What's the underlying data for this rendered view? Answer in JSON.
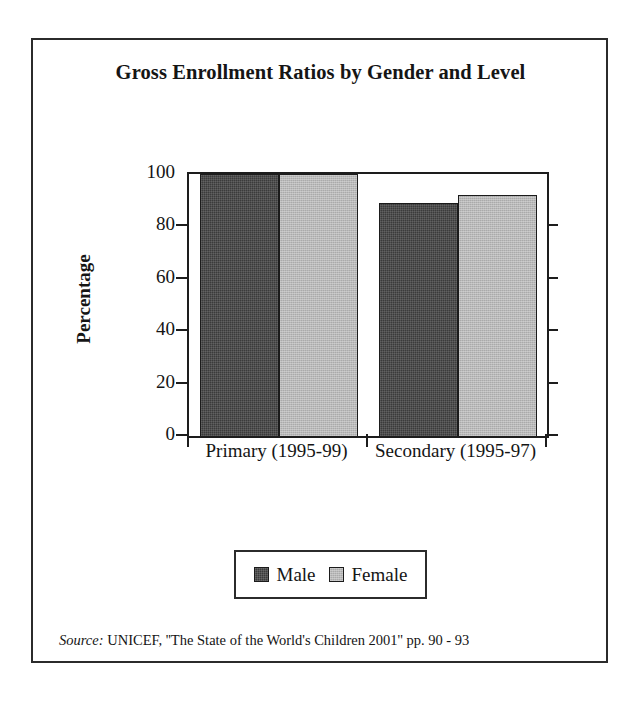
{
  "figure": {
    "title": "Gross Enrollment Ratios by Gender and Level",
    "source_keyword": "Source:",
    "source_text": " UNICEF, ''The State of the World's Children 2001'' pp. 90 - 93"
  },
  "legend": {
    "position": "bottom-center",
    "entries": [
      {
        "label": "Male",
        "color": "#3b3b3b",
        "swatch": "male-swatch"
      },
      {
        "label": "Female",
        "color": "#aaaaaa",
        "swatch": "female-swatch"
      }
    ]
  },
  "axes": {
    "ylabel": "Percentage",
    "yticks": [
      "0",
      "20",
      "40",
      "60",
      "80",
      "100"
    ],
    "xticklabels": [
      "Primary (1995-99)",
      "Secondary (1995-97)"
    ]
  },
  "chart_data": {
    "type": "bar",
    "title": "Gross Enrollment Ratios by Gender and Level",
    "xlabel": "",
    "ylabel": "Percentage",
    "categories": [
      "Primary (1995-99)",
      "Secondary (1995-97)"
    ],
    "series": [
      {
        "name": "Male",
        "color": "#3b3b3b",
        "values": [
          100,
          89
        ]
      },
      {
        "name": "Female",
        "color": "#aaaaaa",
        "values": [
          100,
          92
        ]
      }
    ],
    "ylim": [
      0,
      100
    ],
    "yticks": [
      0,
      20,
      40,
      60,
      80,
      100
    ],
    "grid": false,
    "legend_position": "bottom-center",
    "source": "UNICEF, ''The State of the World's Children 2001'' pp. 90 - 93"
  }
}
